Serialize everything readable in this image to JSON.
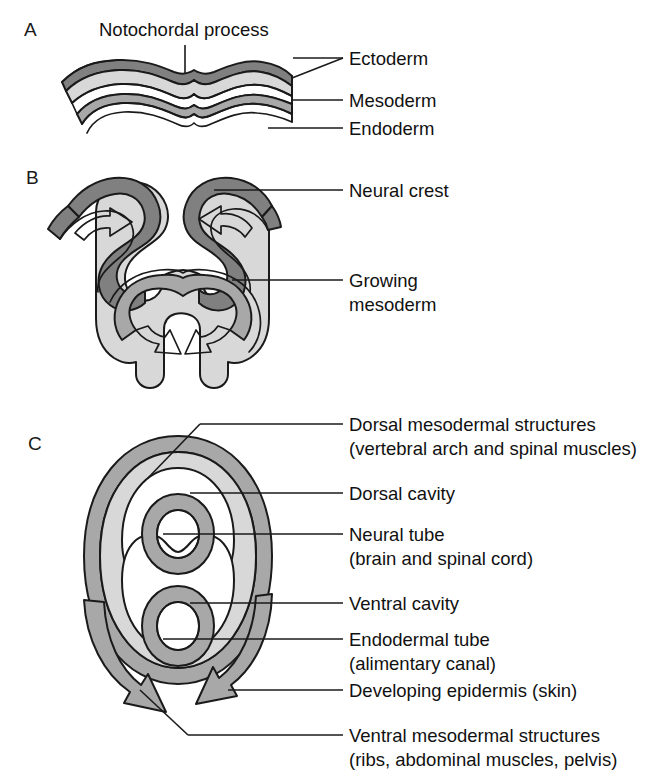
{
  "figure": {
    "background": "#ffffff"
  },
  "colors": {
    "ink": "#1a1a1a",
    "ectoderm_dark_gray": "#808080",
    "mesoderm_light_gray": "#d8d8d8",
    "endoderm_mid_gray": "#a8a8a8",
    "cavity_white": "#ffffff",
    "text": "#111111"
  },
  "panels": [
    {
      "letter": "A",
      "title": "Notochordal process",
      "labels": [
        {
          "text": "Ectoderm"
        },
        {
          "text": "Mesoderm"
        },
        {
          "text": "Endoderm"
        }
      ]
    },
    {
      "letter": "B",
      "labels": [
        {
          "line1": "Neural crest",
          "line2": ""
        },
        {
          "line1": "Growing",
          "line2": "mesoderm"
        }
      ]
    },
    {
      "letter": "C",
      "labels": [
        {
          "line1": "Dorsal mesodermal structures",
          "line2": "(vertebral arch and spinal muscles)"
        },
        {
          "line1": "Dorsal cavity",
          "line2": ""
        },
        {
          "line1": "Neural tube",
          "line2": "(brain and spinal cord)"
        },
        {
          "line1": "Ventral cavity",
          "line2": ""
        },
        {
          "line1": "Endodermal tube",
          "line2": "(alimentary canal)"
        },
        {
          "line1": "Developing epidermis (skin)",
          "line2": ""
        },
        {
          "line1": "Ventral mesodermal structures",
          "line2": "(ribs, abdominal muscles, pelvis)"
        }
      ]
    }
  ]
}
